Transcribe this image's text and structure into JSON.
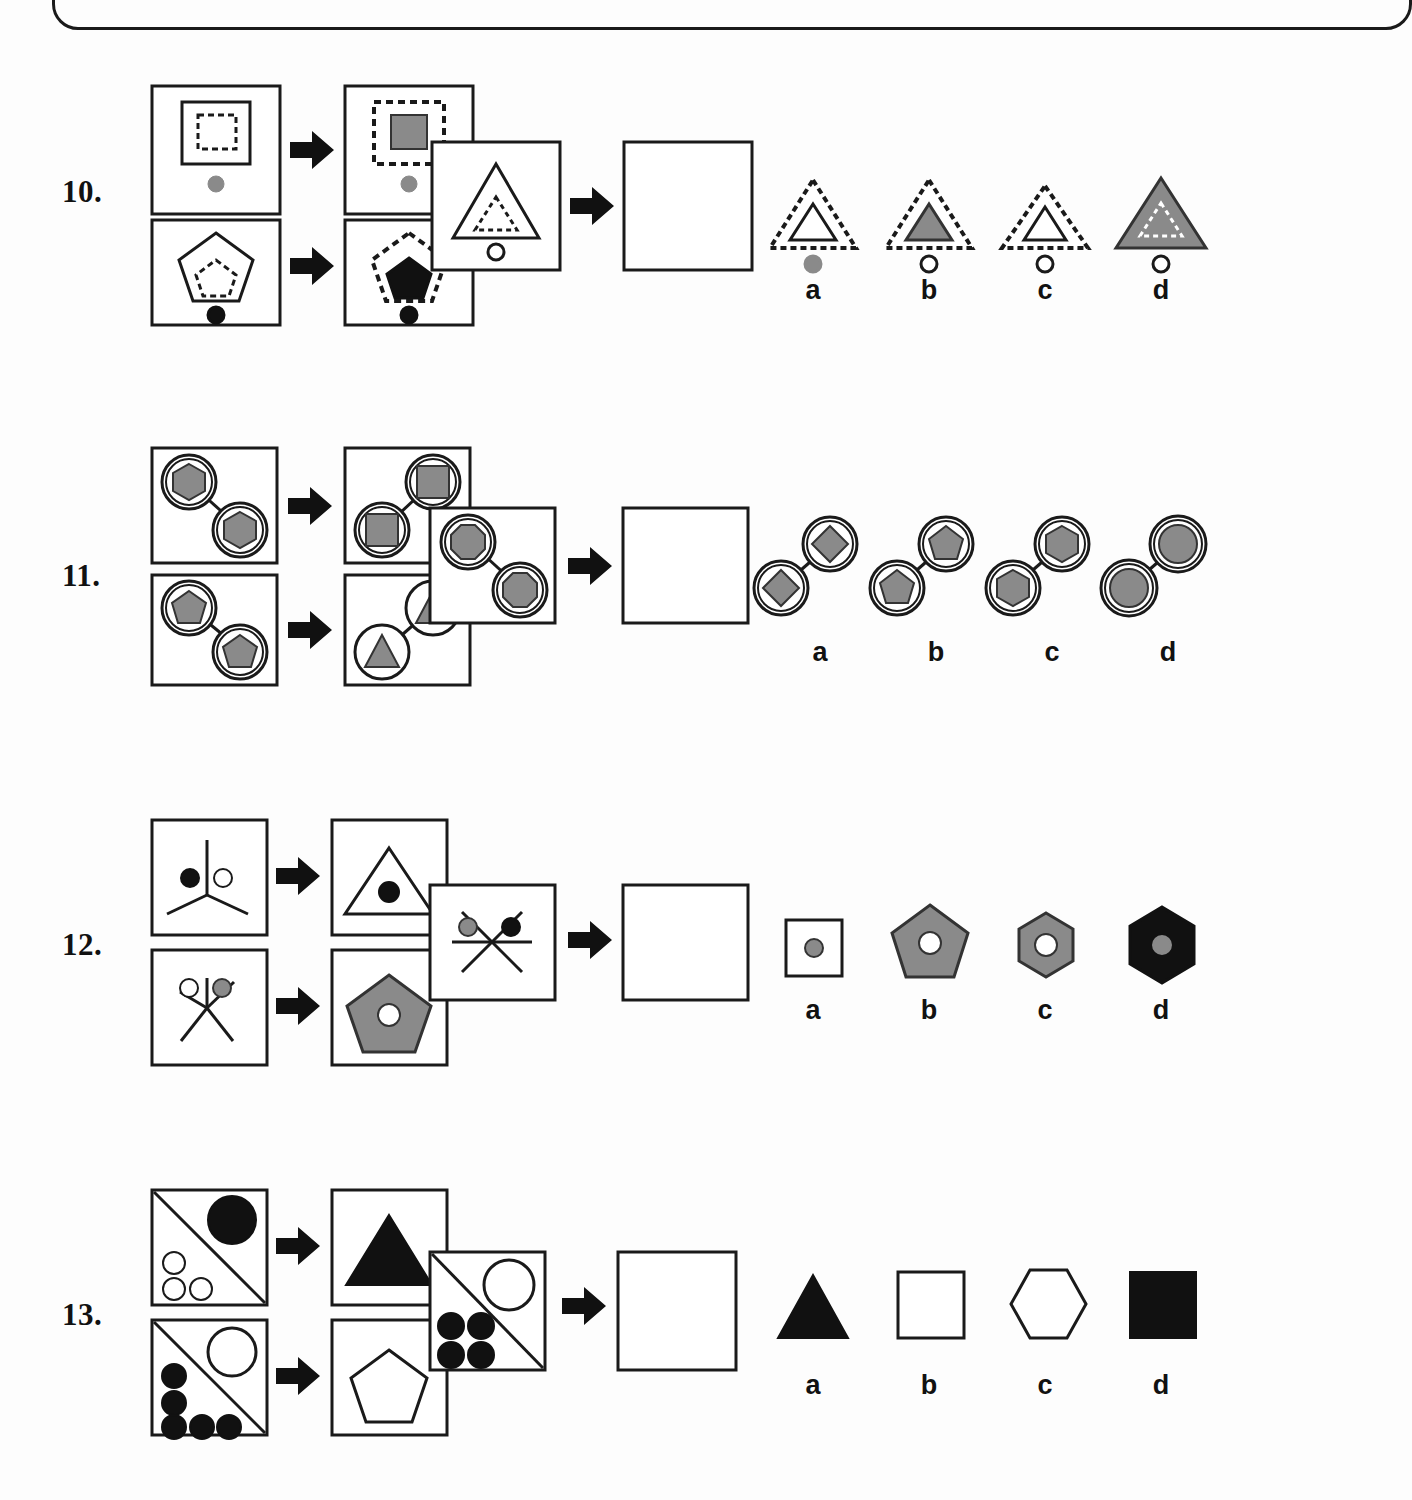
{
  "page": {
    "width": 1286,
    "height": 1500,
    "background_color": "#fdfdfd",
    "ink_color": "#1a1a1a",
    "gray_fill": "#8a8a8a",
    "black_fill": "#111111",
    "white_fill": "#ffffff"
  },
  "top_box": {
    "label": "previous-question-box-bottom-edge"
  },
  "option_letters": [
    "a",
    "b",
    "c",
    "d"
  ],
  "questions": [
    {
      "number": "10.",
      "id": "q10",
      "examples": [
        {
          "input": "outer solid square containing dashed small square, solid gray dot below",
          "output": "outer dashed square containing gray filled small square, gray dot below"
        },
        {
          "input": "outer solid pentagon containing dashed small pentagon, solid black dot below",
          "output": "outer dashed pentagon containing black filled small pentagon, black dot below"
        }
      ],
      "problem": {
        "input": "outer solid triangle containing dashed small triangle, white outlined dot below",
        "output": "empty panel"
      },
      "options": [
        {
          "letter": "a",
          "desc": "dashed outer triangle, white inner solid triangle, gray dot below"
        },
        {
          "letter": "b",
          "desc": "dashed outer triangle, gray inner solid triangle, white dot below"
        },
        {
          "letter": "c",
          "desc": "dashed outer triangle, white inner solid triangle, white dot below"
        },
        {
          "letter": "d",
          "desc": "gray filled outer triangle, dashed white inner triangle, white dot below"
        }
      ]
    },
    {
      "number": "11.",
      "id": "q11",
      "examples": [
        {
          "input": "two double-ringed circles linked by a line, each containing a gray hexagon; upper-left and lower-right",
          "output": "two double-ringed circles linked by a line containing gray squares; upper-right and lower-left"
        },
        {
          "input": "two double-ringed circles linked by a line, each containing a gray pentagon; upper-left and lower-right",
          "output": "two single-ringed circles linked by a line containing gray triangles; upper-right and lower-left"
        }
      ],
      "problem": {
        "input": "two double-ringed circles linked by a line, each containing a gray octagon; upper-left and lower-right",
        "output": "empty panel"
      },
      "options": [
        {
          "letter": "a",
          "desc": "two ringed circles linked diagonally containing gray diamonds"
        },
        {
          "letter": "b",
          "desc": "two ringed circles linked diagonally containing gray pentagons"
        },
        {
          "letter": "c",
          "desc": "two ringed circles linked diagonally containing gray hexagons"
        },
        {
          "letter": "d",
          "desc": "two ringed circles linked diagonally containing gray circles"
        }
      ]
    },
    {
      "number": "12.",
      "id": "q12",
      "examples": [
        {
          "input": "three-spoke star with a black dot left and a white dot right",
          "output": "white triangle with a black dot at its centre"
        },
        {
          "input": "five-spoke star with a white dot left and a gray dot right",
          "output": "gray pentagon with a white dot at its centre"
        }
      ],
      "problem": {
        "input": "six-spoke star with a gray dot left and a black dot right",
        "output": "empty panel"
      },
      "options": [
        {
          "letter": "a",
          "desc": "white square with a gray dot at its centre"
        },
        {
          "letter": "b",
          "desc": "gray pentagon with a white dot at its centre"
        },
        {
          "letter": "c",
          "desc": "gray hexagon with a white dot at its centre"
        },
        {
          "letter": "d",
          "desc": "black hexagon with a gray dot at its centre"
        }
      ]
    },
    {
      "number": "13.",
      "id": "q13",
      "examples": [
        {
          "input": "square split by a diagonal: large black circle top-right, three small white circles bottom-left",
          "output": "black filled triangle"
        },
        {
          "input": "square split by a diagonal: large white circle top-right, five small black circles bottom-left",
          "output": "white outlined pentagon"
        }
      ],
      "problem": {
        "input": "square split by a diagonal: large white circle top-right, four small black circles bottom-left",
        "output": "empty panel"
      },
      "options": [
        {
          "letter": "a",
          "desc": "black filled triangle"
        },
        {
          "letter": "b",
          "desc": "white outlined square"
        },
        {
          "letter": "c",
          "desc": "white outlined hexagon"
        },
        {
          "letter": "d",
          "desc": "black filled square"
        }
      ]
    }
  ]
}
